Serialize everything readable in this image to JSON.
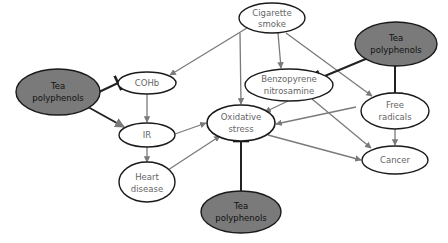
{
  "colors": {
    "background": "#ffffff",
    "node_fill_light": "#ffffff",
    "node_fill_dark": "#7a7a7a",
    "node_stroke": "#1a1a1a",
    "edge_gray": "#7a7a7a",
    "edge_dark": "#222222",
    "text_light_node": "#666666",
    "text_dark_node": "#111111"
  },
  "nodes": {
    "cigarette_smoke": {
      "line1": "Cigarette",
      "line2": "smoke"
    },
    "tea_top_right": {
      "line1": "Tea",
      "line2": "polyphenols"
    },
    "tea_left": {
      "line1": "Tea",
      "line2": "polyphenols"
    },
    "cohb": {
      "label": "COHb"
    },
    "benzopyrene": {
      "line1": "Benzopyrene",
      "line2": "nitrosamine"
    },
    "free_radicals": {
      "line1": "Free",
      "line2": "radicals"
    },
    "ir": {
      "label": "IR"
    },
    "oxidative_stress": {
      "line1": "Oxidative",
      "line2": "stress"
    },
    "cancer": {
      "label": "Cancer"
    },
    "heart_disease": {
      "line1": "Heart",
      "line2": "disease"
    },
    "tea_bottom": {
      "line1": "Tea",
      "line2": "polyphenols"
    }
  },
  "edges": [
    {
      "from": "Cigarette smoke",
      "to": "COHb",
      "type": "promotes"
    },
    {
      "from": "Cigarette smoke",
      "to": "Oxidative stress",
      "type": "promotes"
    },
    {
      "from": "Cigarette smoke",
      "to": "Benzopyrene nitrosamine",
      "type": "promotes"
    },
    {
      "from": "Cigarette smoke",
      "to": "Free radicals",
      "type": "promotes"
    },
    {
      "from": "COHb",
      "to": "IR",
      "type": "promotes"
    },
    {
      "from": "IR",
      "to": "Oxidative stress",
      "type": "promotes"
    },
    {
      "from": "IR",
      "to": "Heart disease",
      "type": "promotes"
    },
    {
      "from": "Heart disease",
      "to": "Oxidative stress",
      "type": "promotes"
    },
    {
      "from": "Benzopyrene nitrosamine",
      "to": "Oxidative stress",
      "type": "promotes"
    },
    {
      "from": "Benzopyrene nitrosamine",
      "to": "Cancer",
      "type": "promotes"
    },
    {
      "from": "Free radicals",
      "to": "Oxidative stress",
      "type": "promotes"
    },
    {
      "from": "Free radicals",
      "to": "Cancer",
      "type": "promotes"
    },
    {
      "from": "Oxidative stress",
      "to": "Cancer",
      "type": "promotes"
    },
    {
      "from": "Tea polyphenols (left)",
      "to": "COHb",
      "type": "inhibits"
    },
    {
      "from": "Tea polyphenols (left)",
      "to": "IR",
      "type": "inhibits"
    },
    {
      "from": "Tea polyphenols (top right)",
      "to": "Benzopyrene nitrosamine",
      "type": "inhibits"
    },
    {
      "from": "Tea polyphenols (top right)",
      "to": "Free radicals",
      "type": "inhibits"
    },
    {
      "from": "Tea polyphenols (bottom)",
      "to": "Oxidative stress",
      "type": "inhibits"
    }
  ]
}
